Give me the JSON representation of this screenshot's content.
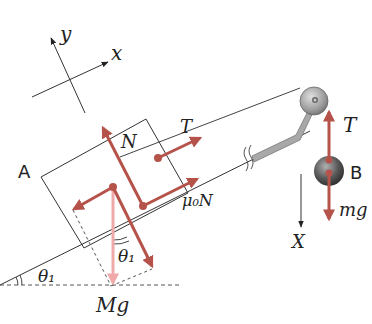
{
  "diagram": {
    "axes": {
      "x_label": "x",
      "y_label": "y",
      "X_label": "X"
    },
    "objects": {
      "block": {
        "label": "A"
      },
      "hanging_mass": {
        "label": "B"
      }
    },
    "forces": {
      "normal": "N",
      "tension_block": "T",
      "friction": "μ₀N",
      "gravity_block": "Mg",
      "tension_mass": "T",
      "gravity_mass": "mg"
    },
    "angles": {
      "incline_angle": "θ₁",
      "component_angle": "θ₁"
    },
    "colors": {
      "force": "#b5524a",
      "force_light": "#f0a8a8",
      "line": "#333333",
      "pulley": "#9a9a9a",
      "bracket": "#a8a8a8"
    }
  }
}
